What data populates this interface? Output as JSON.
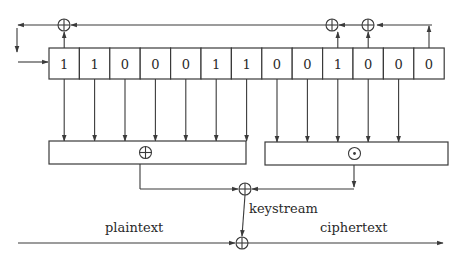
{
  "diagram": {
    "title": "",
    "register": {
      "bits": [
        "1",
        "1",
        "0",
        "0",
        "0",
        "1",
        "1",
        "0",
        "0",
        "1",
        "0",
        "0",
        "0"
      ],
      "x": 49,
      "y": 48,
      "cell_width": 30.4,
      "height": 31
    },
    "feedback": {
      "xor_nodes": [
        {
          "id": "fb1",
          "x": 64,
          "y": 25,
          "tap_cell": 0
        },
        {
          "id": "fb2",
          "x": 332,
          "y": 25,
          "tap_cell": 9
        },
        {
          "id": "fb3",
          "x": 368,
          "y": 25,
          "tap_cell": 10
        }
      ],
      "input_from_right": {
        "from_x": 432,
        "to_x": 377,
        "y": 25,
        "tap_cell": 12
      },
      "output_left": {
        "from_x": 55,
        "to_x": 18,
        "y": 25
      },
      "wrap_down": {
        "x": 17,
        "from_y": 28,
        "to_y": 52
      },
      "register_input": {
        "from_x": 18,
        "to_x": 48,
        "y": 62
      }
    },
    "combiners": [
      {
        "name": "xor-box",
        "symbol": "⊕",
        "x": 49,
        "y": 141,
        "w": 197,
        "h": 23,
        "taps": [
          0,
          1,
          2,
          3,
          4,
          5,
          6
        ],
        "out_x": 140
      },
      {
        "name": "and-box",
        "symbol": "⊙",
        "x": 265,
        "y": 142,
        "w": 183,
        "h": 23,
        "taps": [
          7,
          8,
          9,
          10,
          11
        ],
        "out_x": 354
      }
    ],
    "keystream_xor": {
      "x": 245,
      "y": 189
    },
    "output_xor": {
      "x": 242,
      "y": 243
    },
    "labels": {
      "keystream": "keystream",
      "plaintext": "plaintext",
      "ciphertext": "ciphertext"
    },
    "symbols": {
      "xor": "⊕",
      "and": "⊙"
    },
    "colors": {
      "line": "#3a3a3a",
      "text": "#2a2a2a",
      "background": "#ffffff"
    }
  }
}
